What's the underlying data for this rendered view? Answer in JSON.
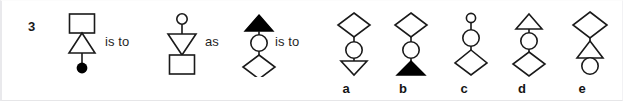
{
  "puzzle": {
    "question_number": "3",
    "connectors": [
      {
        "id": "connector-1",
        "text": "is to"
      },
      {
        "id": "connector-2",
        "text": "as"
      },
      {
        "id": "connector-3",
        "text": "is to"
      }
    ],
    "prompt_figures": [
      {
        "name": "figure-a1",
        "description": "square above upward triangle above filled circle",
        "shapes": [
          "square-outline",
          "triangle-up-outline",
          "circle-filled"
        ]
      },
      {
        "name": "figure-a2",
        "description": "small circle above downward triangle above square",
        "shapes": [
          "circle-small-outline",
          "triangle-down-outline",
          "square-outline"
        ]
      },
      {
        "name": "figure-b1",
        "description": "filled upward triangle above circle above diamond",
        "shapes": [
          "triangle-up-filled",
          "circle-outline",
          "diamond-outline"
        ]
      }
    ],
    "answer_options": [
      {
        "label": "a",
        "name": "option-a",
        "description": "diamond above circle above downward triangle",
        "shapes": [
          "diamond-outline",
          "circle-outline",
          "triangle-down-outline"
        ]
      },
      {
        "label": "b",
        "name": "option-b",
        "description": "diamond above circle above filled upward triangle",
        "shapes": [
          "diamond-outline",
          "circle-outline",
          "triangle-up-filled"
        ]
      },
      {
        "label": "c",
        "name": "option-c",
        "description": "small circle above circle above diamond",
        "shapes": [
          "circle-small-outline",
          "circle-outline",
          "diamond-outline"
        ]
      },
      {
        "label": "d",
        "name": "option-d",
        "description": "upward triangle above circle above diamond",
        "shapes": [
          "triangle-up-outline",
          "circle-outline",
          "diamond-outline"
        ]
      },
      {
        "label": "e",
        "name": "option-e",
        "description": "diamond above upward triangle above circle",
        "shapes": [
          "diamond-outline",
          "triangle-up-outline",
          "circle-outline"
        ]
      }
    ],
    "colors": {
      "stroke": "#1a1a1a",
      "fill_solid": "#000000",
      "fill_open": "#ffffff",
      "background": "#ffffff",
      "border": "#e9e9ec",
      "text": "#141414"
    }
  }
}
